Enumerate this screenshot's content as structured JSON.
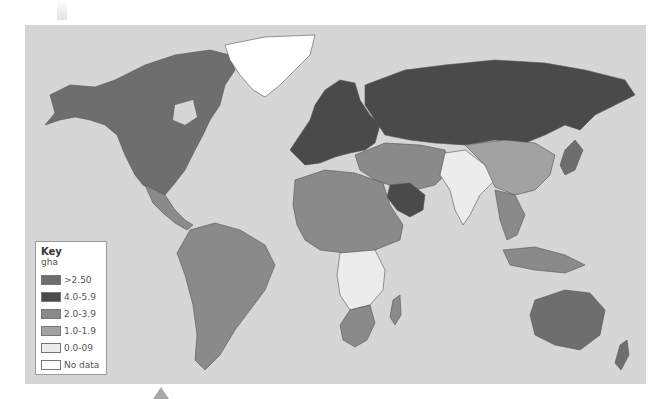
{
  "legend": {
    "title": "Key",
    "unit": "gha",
    "items": [
      {
        "label": ">2.50",
        "color": "#6e6e6e"
      },
      {
        "label": "4.0-5.9",
        "color": "#4a4a4a"
      },
      {
        "label": "2.0-3.9",
        "color": "#8a8a8a"
      },
      {
        "label": "1.0-1.9",
        "color": "#a2a2a2"
      },
      {
        "label": "0.0-09",
        "color": "#ececec"
      },
      {
        "label": "No data",
        "color": "#ffffff"
      }
    ]
  },
  "map": {
    "ocean_color": "#d6d6d6",
    "regions": {
      "north_america": "#6e6e6e",
      "greenland": "#ffffff",
      "central_america": "#8a8a8a",
      "south_america": "#8a8a8a",
      "europe": "#4a4a4a",
      "russia": "#4a4a4a",
      "middle_east": "#8a8a8a",
      "saudi_arabia": "#4a4a4a",
      "africa_north": "#8a8a8a",
      "africa_central": "#ececec",
      "africa_south": "#8a8a8a",
      "madagascar": "#8a8a8a",
      "south_asia": "#ececec",
      "china": "#a2a2a2",
      "southeast_asia": "#8a8a8a",
      "indonesia": "#8a8a8a",
      "australia": "#6e6e6e",
      "new_zealand": "#6e6e6e",
      "japan": "#6e6e6e"
    }
  }
}
